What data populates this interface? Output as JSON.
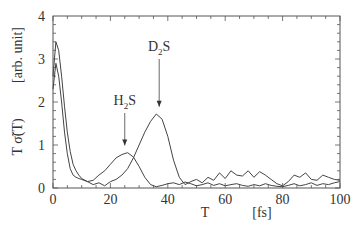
{
  "chart_data": {
    "type": "line",
    "title": "",
    "xlabel": "T",
    "xunit": "[fs]",
    "ylabel": "T σ̃(T)",
    "yunit": "[arb. unit]",
    "xlim": [
      0,
      100
    ],
    "ylim": [
      0,
      4
    ],
    "xticks": [
      "0",
      "20",
      "40",
      "60",
      "80",
      "100"
    ],
    "yticks": [
      "0",
      "1",
      "2",
      "3",
      "4"
    ],
    "grid": false,
    "annotations": [
      {
        "label": "H",
        "sub": "2",
        "suffix": "S",
        "x": 25,
        "arrow_to_y": 0.85
      },
      {
        "label": "D",
        "sub": "2",
        "suffix": "S",
        "x": 37,
        "arrow_to_y": 1.75
      }
    ],
    "series": [
      {
        "name": "H2S",
        "x": [
          0,
          1,
          2,
          3,
          4,
          5,
          6,
          7,
          8,
          9,
          10,
          12,
          14,
          16,
          18,
          20,
          22,
          24,
          26,
          28,
          30,
          32,
          34,
          36,
          38,
          40,
          42,
          44,
          46,
          48,
          50,
          52,
          54,
          56,
          58,
          60,
          62,
          64,
          66,
          68,
          70,
          72,
          74,
          76,
          78,
          80,
          82,
          84,
          86,
          88,
          90,
          92,
          94,
          96,
          98,
          100
        ],
        "y": [
          2.3,
          2.9,
          2.6,
          2.0,
          1.3,
          0.8,
          0.45,
          0.3,
          0.25,
          0.22,
          0.2,
          0.15,
          0.18,
          0.3,
          0.4,
          0.55,
          0.7,
          0.78,
          0.82,
          0.72,
          0.5,
          0.25,
          0.08,
          0.03,
          0.06,
          0.1,
          0.12,
          0.08,
          0.14,
          0.1,
          0.05,
          0.08,
          0.12,
          0.06,
          0.1,
          0.05,
          0.08,
          0.1,
          0.06,
          0.04,
          0.08,
          0.05,
          0.1,
          0.06,
          0.04,
          0.03,
          0.06,
          0.1,
          0.05,
          0.08,
          0.12,
          0.06,
          0.1,
          0.08,
          0.12,
          0.15
        ]
      },
      {
        "name": "D2S",
        "x": [
          0,
          1,
          2,
          3,
          4,
          5,
          6,
          7,
          8,
          9,
          10,
          12,
          14,
          16,
          18,
          20,
          22,
          24,
          26,
          28,
          30,
          32,
          34,
          36,
          38,
          40,
          42,
          44,
          46,
          48,
          50,
          52,
          54,
          56,
          58,
          60,
          62,
          64,
          66,
          68,
          70,
          72,
          74,
          76,
          78,
          80,
          82,
          84,
          86,
          88,
          90,
          92,
          94,
          96,
          98,
          100
        ],
        "y": [
          2.6,
          3.4,
          3.2,
          2.6,
          1.9,
          1.3,
          0.85,
          0.55,
          0.4,
          0.3,
          0.22,
          0.15,
          0.08,
          0.12,
          0.05,
          0.15,
          0.2,
          0.3,
          0.45,
          0.7,
          1.0,
          1.3,
          1.55,
          1.72,
          1.6,
          1.2,
          0.65,
          0.25,
          0.08,
          0.15,
          0.2,
          0.12,
          0.25,
          0.18,
          0.35,
          0.22,
          0.4,
          0.3,
          0.28,
          0.4,
          0.25,
          0.38,
          0.3,
          0.2,
          0.1,
          0.05,
          0.15,
          0.3,
          0.25,
          0.35,
          0.2,
          0.18,
          0.3,
          0.25,
          0.2,
          0.18
        ]
      }
    ]
  }
}
